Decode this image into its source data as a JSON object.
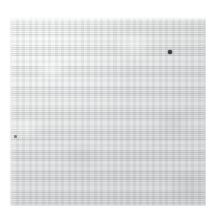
{
  "image": {
    "subject": "woven fabric swatch",
    "description": "Close-up photograph of a plain light grey woven textile swatch on a white background",
    "background_color": "#ffffff",
    "canvas": {
      "width": 215,
      "height": 220
    }
  },
  "swatch": {
    "name": "fabric-swatch",
    "shape": "rectangle",
    "position": {
      "x": 9,
      "y": 17,
      "width": 197,
      "height": 189
    },
    "material": "woven cloth",
    "weave": "fine plain weave grid",
    "base_color": "#e4e5e5",
    "highlight_color": "#eceded",
    "shadow_color": "#d7d9da",
    "thread_light": "#ffffff",
    "thread_dark": "#aaaeb0",
    "tone_note": "lighter toward top-left, slightly cooler and darker toward bottom-right"
  },
  "flecks": [
    {
      "name": "dark-fleck-upper-right",
      "position": {
        "x": 168,
        "y": 50,
        "width": 4,
        "height": 4
      },
      "color": "#3c3e40",
      "prominence": "strong"
    },
    {
      "name": "faint-fleck-left",
      "position": {
        "x": 14,
        "y": 135,
        "width": 3,
        "height": 3
      },
      "color": "#7e8386",
      "prominence": "faint"
    }
  ]
}
